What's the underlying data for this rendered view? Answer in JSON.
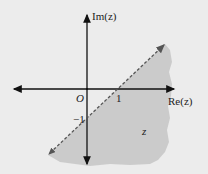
{
  "diagram": {
    "axes": {
      "x_label": "Re(z)",
      "y_label": "Im(z)",
      "origin_label": "O",
      "x_tick_label": "1",
      "y_tick_label": "−1"
    },
    "boundary_line": {
      "style": "dashed",
      "passes_through": [
        [
          1,
          0
        ],
        [
          0,
          -1
        ]
      ],
      "equation": "Im(z) = Re(z) − 1"
    },
    "region": {
      "label": "z",
      "description": "shaded region below/right of the dashed line"
    },
    "colors": {
      "background": "#ececec",
      "region_fill": "#c8c8c8",
      "axis": "#111111",
      "dashed_line": "#555555"
    }
  }
}
